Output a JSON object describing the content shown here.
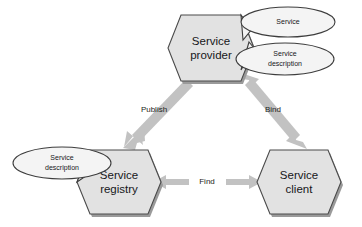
{
  "diagram": {
    "colors": {
      "node_fill": "#e2e2e2",
      "node_stroke": "#4a4a4a",
      "artifact_fill": "#f4f4f4",
      "arrow_fill": "#c2c2c2",
      "shadow": "#9a9a9a",
      "background": "#ffffff",
      "text": "#16171a"
    },
    "nodes": [
      {
        "id": "service-provider",
        "label_line1": "Service",
        "label_line2": "provider",
        "shape": "hexagon",
        "cx": 211,
        "cy": 47
      },
      {
        "id": "service-registry",
        "label_line1": "Service",
        "label_line2": "registry",
        "shape": "hexagon",
        "cx": 118,
        "cy": 182
      },
      {
        "id": "service-client",
        "label_line1": "Service",
        "label_line2": "client",
        "shape": "hexagon",
        "cx": 298,
        "cy": 182
      }
    ],
    "artifacts": [
      {
        "id": "provider-service",
        "label_line1": "Service",
        "label_line2": "",
        "shape": "ellipse",
        "cx": 288,
        "cy": 22,
        "attached_to": "service-provider"
      },
      {
        "id": "provider-service-description",
        "label_line1": "Service",
        "label_line2": "description",
        "shape": "ellipse",
        "cx": 285,
        "cy": 59,
        "attached_to": "service-provider"
      },
      {
        "id": "registry-service-description",
        "label_line1": "Service",
        "label_line2": "description",
        "shape": "ellipse",
        "cx": 62,
        "cy": 163,
        "attached_to": "service-registry"
      }
    ],
    "edges": [
      {
        "id": "publish",
        "label": "Publish",
        "from": "service-provider",
        "to": "service-registry",
        "heads": "single",
        "label_x": 154,
        "label_y": 110
      },
      {
        "id": "bind",
        "label": "Bind",
        "from": "service-client",
        "to": "service-provider",
        "heads": "double",
        "label_x": 273,
        "label_y": 110
      },
      {
        "id": "find",
        "label": "Find",
        "from": "service-registry",
        "to": "service-client",
        "heads": "double",
        "label_x": 207,
        "label_y": 182
      }
    ]
  }
}
